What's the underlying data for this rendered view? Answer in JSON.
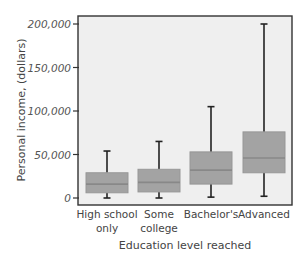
{
  "chart_data": {
    "type": "box",
    "title": "",
    "xlabel": "Education level reached",
    "ylabel": "Personal income, (dollars)",
    "ylim": [
      0,
      200000
    ],
    "yticks": [
      0,
      50000,
      100000,
      150000,
      200000
    ],
    "ytick_labels": [
      "0",
      "50,000",
      "100,000",
      "150,000",
      "200,000"
    ],
    "grid": false,
    "legend": null,
    "categories": [
      {
        "label_lines": [
          "High school",
          "only"
        ],
        "label": "High school only"
      },
      {
        "label_lines": [
          "Some",
          "college"
        ],
        "label": "Some college"
      },
      {
        "label_lines": [
          "Bachelor's",
          ""
        ],
        "label": "Bachelor's"
      },
      {
        "label_lines": [
          "Advanced",
          ""
        ],
        "label": "Advanced"
      }
    ],
    "series": [
      {
        "name": "High school only",
        "min": 0,
        "q1": 6000,
        "median": 16000,
        "q3": 29000,
        "max": 54000
      },
      {
        "name": "Some college",
        "min": 0,
        "q1": 7000,
        "median": 18000,
        "q3": 33000,
        "max": 65000
      },
      {
        "name": "Bachelor's",
        "min": 1000,
        "q1": 16000,
        "median": 32000,
        "q3": 53000,
        "max": 105000
      },
      {
        "name": "Advanced",
        "min": 2000,
        "q1": 29000,
        "median": 46000,
        "q3": 76000,
        "max": 200000
      }
    ],
    "colors": {
      "plot_background": "#efefef",
      "box_fill": "#a3a3a3",
      "box_border": "#979797",
      "median_line": "#888888",
      "whisker": "#222222",
      "frame": "#333333"
    }
  }
}
